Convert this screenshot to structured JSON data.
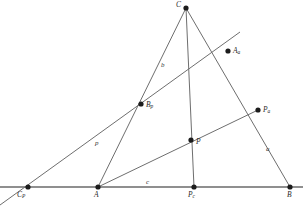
{
  "figure": {
    "type": "euclidean-geometry-diagram",
    "width": 303,
    "height": 209,
    "background_color": "#ffffff",
    "line_color": "#6e6e6e",
    "point_color": "#1c1c1c",
    "label_color": "#2b2b2b"
  },
  "points": [
    {
      "id": "C",
      "base": "C",
      "sub": "",
      "x": 186,
      "y": 8,
      "label_x": 176,
      "label_y": 1,
      "label_anchor": "upper-left"
    },
    {
      "id": "Aa",
      "base": "A",
      "sub": "a",
      "x": 228,
      "y": 51,
      "label_x": 233,
      "label_y": 48,
      "label_anchor": "right"
    },
    {
      "id": "Bp",
      "base": "B",
      "sub": "p",
      "x": 141,
      "y": 104,
      "label_x": 146,
      "label_y": 102,
      "label_anchor": "right"
    },
    {
      "id": "Pa",
      "base": "P",
      "sub": "a",
      "x": 258,
      "y": 110,
      "label_x": 263,
      "label_y": 107,
      "label_anchor": "right"
    },
    {
      "id": "P",
      "base": "P",
      "sub": "",
      "x": 191,
      "y": 140,
      "label_x": 196,
      "label_y": 139,
      "label_anchor": "right"
    },
    {
      "id": "Cp",
      "base": "C",
      "sub": "P",
      "x": 28,
      "y": 187,
      "label_x": 18,
      "label_y": 191,
      "label_anchor": "below-left"
    },
    {
      "id": "A",
      "base": "A",
      "sub": "",
      "x": 98,
      "y": 187,
      "label_x": 94,
      "label_y": 191,
      "label_anchor": "below"
    },
    {
      "id": "Pc",
      "base": "P",
      "sub": "c",
      "x": 194,
      "y": 187,
      "label_x": 188,
      "label_y": 191,
      "label_anchor": "below"
    },
    {
      "id": "B",
      "base": "B",
      "sub": "",
      "x": 290,
      "y": 187,
      "label_x": 287,
      "label_y": 191,
      "label_anchor": "below"
    }
  ],
  "segments": [
    {
      "id": "baseline",
      "from": "Cp-extended-left",
      "to": "B",
      "x1": 0,
      "y1": 187,
      "x2": 303,
      "y2": 187,
      "weight": "base"
    },
    {
      "id": "side-b-A-to-C",
      "from": "A",
      "to": "C",
      "x1": 98,
      "y1": 187,
      "x2": 186,
      "y2": 8,
      "weight": "normal"
    },
    {
      "id": "side-a-C-to-B",
      "from": "C",
      "to": "B",
      "x1": 186,
      "y1": 8,
      "x2": 290,
      "y2": 187,
      "weight": "normal"
    },
    {
      "id": "cevian-C-to-Pc",
      "from": "C",
      "to": "Pc",
      "x1": 186,
      "y1": 8,
      "x2": 194,
      "y2": 187,
      "weight": "normal"
    },
    {
      "id": "cevian-A-to-Pa",
      "from": "A",
      "to": "Pa",
      "x1": 98,
      "y1": 187,
      "x2": 258,
      "y2": 110,
      "weight": "normal"
    },
    {
      "id": "transversal-p",
      "from": "Cp-extended",
      "to": "Aa-extended",
      "x1": 0,
      "y1": 205,
      "x2": 240,
      "y2": 32,
      "weight": "normal"
    }
  ],
  "side_labels": [
    {
      "id": "label-b",
      "text": "b",
      "x": 161,
      "y": 62
    },
    {
      "id": "label-p",
      "text": "p",
      "x": 95,
      "y": 140
    },
    {
      "id": "label-a",
      "text": "a",
      "x": 266,
      "y": 146
    },
    {
      "id": "label-c",
      "text": "c",
      "x": 146,
      "y": 179
    }
  ]
}
